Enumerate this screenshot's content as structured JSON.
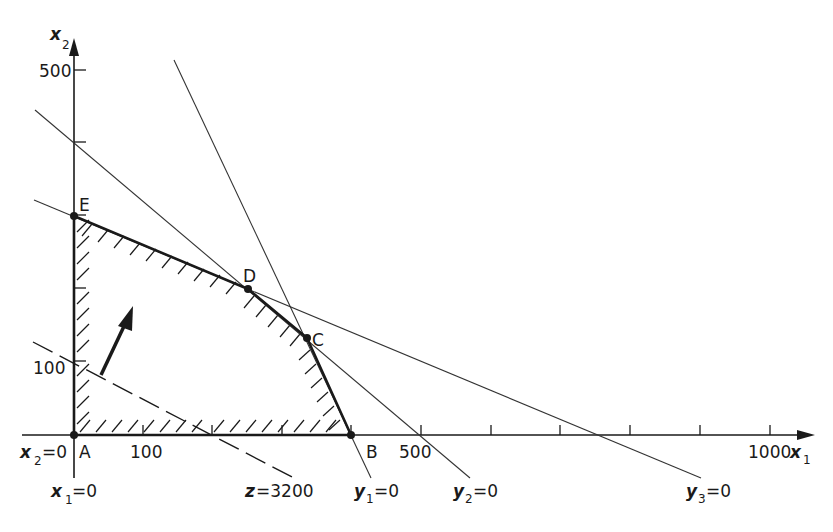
{
  "diagram": {
    "type": "linear-programming-feasible-region",
    "axes": {
      "x": {
        "label": "x",
        "subscript": "1",
        "ticks": [
          100,
          200,
          300,
          400,
          500,
          600,
          700,
          800,
          900,
          1000
        ],
        "tick_labels": {
          "100": "100",
          "500": "500",
          "1000": "1000"
        }
      },
      "y": {
        "label": "x",
        "subscript": "2",
        "ticks": [
          100,
          200,
          300,
          400,
          500
        ],
        "tick_labels": {
          "100": "100",
          "500": "500"
        }
      }
    },
    "vertices": [
      {
        "name": "A",
        "x1": 0,
        "x2": 0
      },
      {
        "name": "B",
        "x1": 400,
        "x2": 0
      },
      {
        "name": "C",
        "x1": 335,
        "x2": 133
      },
      {
        "name": "D",
        "x1": 250,
        "x2": 200
      },
      {
        "name": "E",
        "x1": 0,
        "x2": 300
      }
    ],
    "constraint_lines": [
      {
        "label": "y",
        "subscript": "1",
        "eq": "=0"
      },
      {
        "label": "y",
        "subscript": "2",
        "eq": "=0"
      },
      {
        "label": "y",
        "subscript": "3",
        "eq": "=0"
      }
    ],
    "axis_lines": [
      {
        "label": "x",
        "subscript": "1",
        "eq": "=0"
      },
      {
        "label": "x",
        "subscript": "2",
        "eq": "=0"
      }
    ],
    "objective": {
      "label": "z",
      "eq": "=3200"
    },
    "texts": {
      "A": "A",
      "B": "B",
      "C": "C",
      "D": "D",
      "E": "E",
      "t100x": "100",
      "t500x": "500",
      "t1000x": "1000",
      "t100y": "100",
      "t500y": "500",
      "x": "x",
      "y": "y",
      "z": "z",
      "s1": "1",
      "s2": "2",
      "s3": "3",
      "eq0": "=0",
      "eqz": "=3200"
    }
  }
}
